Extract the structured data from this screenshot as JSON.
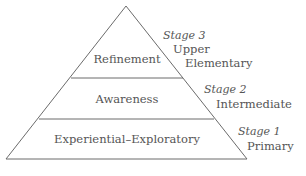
{
  "diagram": {
    "type": "pyramid",
    "tiers": [
      {
        "label": "Refinement",
        "stage": "Stage 3",
        "level_line1": "Upper",
        "level_line2": "Elementary"
      },
      {
        "label": "Awareness",
        "stage": "Stage 2",
        "level_line1": "Intermediate"
      },
      {
        "label": "Experiential–Exploratory",
        "stage": "Stage 1",
        "level_line1": "Primary"
      }
    ],
    "colors": {
      "line": "#6b6b6b",
      "text": "#555555",
      "background": "#ffffff"
    }
  }
}
